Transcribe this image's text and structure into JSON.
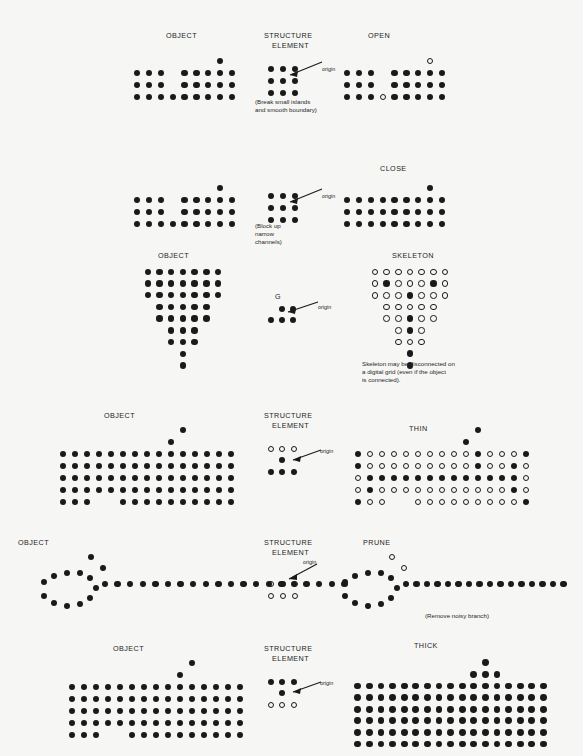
{
  "figure": {
    "title_visible": false,
    "background_color": "#f6f6f4",
    "ink_color": "#1a1a1a",
    "dot_diameter_px": 5.2
  },
  "labels": {
    "object": "OBJECT",
    "structure_element_line1": "STRUCTURE",
    "structure_element_line2": "ELEMENT",
    "open": "OPEN",
    "close": "CLOSE",
    "skeleton": "SKELETON",
    "thin": "THIN",
    "prune": "PRUNE",
    "thick": "THICK",
    "g": "G",
    "origin": "origin"
  },
  "captions": {
    "open_note_line1": "(Break small islands",
    "open_note_line2": "and smooth boundary)",
    "close_note_line1": "(Block up",
    "close_note_line2": "narrow",
    "close_note_line3": "channels)",
    "skeleton_note_line1": "Skeleton may be disconnected on",
    "skeleton_note_line2": "a digital grid (even if the object",
    "skeleton_note_line3": "is connected).",
    "prune_note": "(Remove noisy branch)"
  },
  "rows": [
    {
      "id": "row-open",
      "label_object": "OBJECT",
      "label_se_1": "STRUCTURE",
      "label_se_2": "ELEMENT",
      "label_result": "OPEN",
      "object_grid": {
        "cols": 9,
        "rows": 4,
        "cells": [
          [
            0,
            0,
            0,
            0,
            0,
            0,
            0,
            1,
            0
          ],
          [
            1,
            1,
            1,
            0,
            1,
            1,
            1,
            1,
            1
          ],
          [
            1,
            1,
            1,
            0,
            1,
            1,
            1,
            1,
            1
          ],
          [
            1,
            1,
            1,
            1,
            1,
            1,
            1,
            1,
            1
          ]
        ]
      },
      "se_grid": {
        "cols": 3,
        "rows": 3,
        "cells": [
          [
            1,
            1,
            1
          ],
          [
            1,
            1,
            1
          ],
          [
            1,
            1,
            1
          ]
        ],
        "origin_row": 1,
        "origin_col": 1
      },
      "result_grid": {
        "cols": 9,
        "rows": 4,
        "cells": [
          [
            0,
            0,
            0,
            0,
            0,
            0,
            0,
            2,
            0
          ],
          [
            1,
            1,
            1,
            0,
            1,
            1,
            1,
            1,
            1
          ],
          [
            1,
            1,
            1,
            0,
            1,
            1,
            1,
            1,
            1
          ],
          [
            1,
            1,
            1,
            2,
            1,
            1,
            1,
            1,
            1
          ]
        ]
      }
    },
    {
      "id": "row-close",
      "label_se_1": "STRUCTURE",
      "label_se_2": "ELEMENT",
      "label_result": "CLOSE",
      "object_grid": {
        "cols": 9,
        "rows": 4,
        "cells": [
          [
            0,
            0,
            0,
            0,
            0,
            0,
            0,
            1,
            0
          ],
          [
            1,
            1,
            1,
            0,
            1,
            1,
            1,
            1,
            1
          ],
          [
            1,
            1,
            1,
            0,
            1,
            1,
            1,
            1,
            1
          ],
          [
            1,
            1,
            1,
            1,
            1,
            1,
            1,
            1,
            1
          ]
        ]
      },
      "se_grid": {
        "cols": 3,
        "rows": 3,
        "cells": [
          [
            1,
            1,
            1
          ],
          [
            1,
            1,
            1
          ],
          [
            1,
            1,
            1
          ]
        ],
        "origin_row": 1,
        "origin_col": 1
      },
      "result_grid": {
        "cols": 9,
        "rows": 4,
        "cells": [
          [
            0,
            0,
            0,
            0,
            0,
            0,
            0,
            1,
            0
          ],
          [
            1,
            1,
            1,
            1,
            1,
            1,
            1,
            1,
            1
          ],
          [
            1,
            1,
            1,
            1,
            1,
            1,
            1,
            1,
            1
          ],
          [
            1,
            1,
            1,
            1,
            1,
            1,
            1,
            1,
            1
          ]
        ]
      }
    },
    {
      "id": "row-skeleton",
      "label_object": "OBJECT",
      "label_se": "G",
      "label_result": "SKELETON",
      "object_grid": {
        "cols": 7,
        "rows": 9,
        "cells": [
          [
            1,
            1,
            1,
            1,
            1,
            1,
            1
          ],
          [
            1,
            1,
            1,
            1,
            1,
            1,
            1
          ],
          [
            1,
            1,
            1,
            1,
            1,
            1,
            1
          ],
          [
            0,
            1,
            1,
            1,
            1,
            1,
            0
          ],
          [
            0,
            1,
            1,
            1,
            1,
            1,
            0
          ],
          [
            0,
            0,
            1,
            1,
            1,
            0,
            0
          ],
          [
            0,
            0,
            1,
            1,
            1,
            0,
            0
          ],
          [
            0,
            0,
            0,
            1,
            0,
            0,
            0
          ],
          [
            0,
            0,
            0,
            1,
            0,
            0,
            0
          ]
        ]
      },
      "se_grid": {
        "cols": 3,
        "rows": 2,
        "cells": [
          [
            0,
            1,
            1
          ],
          [
            1,
            1,
            1
          ]
        ],
        "origin_row": 0,
        "origin_col": 2
      },
      "result_grid": {
        "cols": 7,
        "rows": 9,
        "cells": [
          [
            2,
            2,
            2,
            2,
            2,
            2,
            2
          ],
          [
            2,
            1,
            2,
            2,
            2,
            1,
            2
          ],
          [
            2,
            2,
            2,
            1,
            2,
            2,
            2
          ],
          [
            0,
            2,
            2,
            2,
            2,
            2,
            0
          ],
          [
            0,
            2,
            2,
            1,
            2,
            2,
            0
          ],
          [
            0,
            0,
            2,
            1,
            2,
            0,
            0
          ],
          [
            0,
            0,
            2,
            2,
            2,
            0,
            0
          ],
          [
            0,
            0,
            0,
            1,
            0,
            0,
            0
          ],
          [
            0,
            0,
            0,
            1,
            0,
            0,
            0
          ]
        ]
      }
    },
    {
      "id": "row-thin",
      "label_object": "OBJECT",
      "label_se_1": "STRUCTURE",
      "label_se_2": "ELEMENT",
      "label_result": "THIN",
      "object_grid": {
        "cols": 15,
        "rows": 7,
        "cells": [
          [
            0,
            0,
            0,
            0,
            0,
            0,
            0,
            0,
            0,
            0,
            1,
            0,
            0,
            0,
            0
          ],
          [
            0,
            0,
            0,
            0,
            0,
            0,
            0,
            0,
            0,
            1,
            0,
            0,
            0,
            0,
            0
          ],
          [
            1,
            1,
            1,
            1,
            1,
            1,
            1,
            1,
            1,
            1,
            1,
            1,
            1,
            1,
            1
          ],
          [
            1,
            1,
            1,
            1,
            1,
            1,
            1,
            1,
            1,
            1,
            1,
            1,
            1,
            1,
            1
          ],
          [
            1,
            1,
            1,
            1,
            1,
            1,
            1,
            1,
            1,
            1,
            1,
            1,
            1,
            1,
            1
          ],
          [
            1,
            1,
            1,
            1,
            1,
            1,
            1,
            1,
            1,
            1,
            1,
            1,
            1,
            1,
            1
          ],
          [
            1,
            1,
            1,
            0,
            0,
            1,
            1,
            1,
            1,
            1,
            1,
            1,
            1,
            1,
            1
          ]
        ]
      },
      "se_grid": {
        "cols": 3,
        "rows": 3,
        "cells": [
          [
            2,
            2,
            2
          ],
          [
            0,
            1,
            0
          ],
          [
            1,
            1,
            1
          ]
        ],
        "origin_row": 0,
        "origin_col": 2
      },
      "result_grid": {
        "cols": 15,
        "rows": 7,
        "cells": [
          [
            0,
            0,
            0,
            0,
            0,
            0,
            0,
            0,
            0,
            0,
            1,
            0,
            0,
            0,
            0
          ],
          [
            0,
            0,
            0,
            0,
            0,
            0,
            0,
            0,
            0,
            1,
            0,
            0,
            0,
            0,
            0
          ],
          [
            1,
            2,
            2,
            2,
            2,
            2,
            2,
            2,
            2,
            2,
            1,
            2,
            2,
            2,
            1
          ],
          [
            1,
            2,
            2,
            2,
            2,
            2,
            2,
            2,
            2,
            2,
            1,
            2,
            2,
            1,
            2
          ],
          [
            2,
            1,
            1,
            1,
            1,
            1,
            1,
            1,
            1,
            1,
            1,
            1,
            1,
            1,
            2
          ],
          [
            2,
            1,
            2,
            2,
            2,
            2,
            2,
            2,
            2,
            2,
            2,
            2,
            2,
            1,
            2
          ],
          [
            1,
            2,
            2,
            0,
            0,
            2,
            2,
            2,
            2,
            2,
            2,
            2,
            2,
            2,
            1
          ]
        ]
      }
    },
    {
      "id": "row-prune",
      "label_object": "OBJECT",
      "label_se_1": "STRUCTURE",
      "label_se_2": "ELEMENT",
      "label_result": "PRUNE",
      "object_shape": "loop-with-tail-and-branch",
      "se_grid": {
        "cols": 3,
        "rows": 2,
        "cells": [
          [
            2,
            1,
            2
          ],
          [
            2,
            2,
            2
          ]
        ],
        "origin_row": 0,
        "origin_col": 1
      }
    },
    {
      "id": "row-thick",
      "label_object": "OBJECT",
      "label_se_1": "STRUCTURE",
      "label_se_2": "ELEMENT",
      "label_result": "THICK",
      "object_grid": {
        "cols": 15,
        "rows": 7,
        "cells": [
          [
            0,
            0,
            0,
            0,
            0,
            0,
            0,
            0,
            0,
            0,
            1,
            0,
            0,
            0,
            0
          ],
          [
            0,
            0,
            0,
            0,
            0,
            0,
            0,
            0,
            0,
            1,
            0,
            0,
            0,
            0,
            0
          ],
          [
            1,
            1,
            1,
            1,
            1,
            1,
            1,
            1,
            1,
            1,
            1,
            1,
            1,
            1,
            1
          ],
          [
            1,
            1,
            1,
            1,
            1,
            1,
            1,
            1,
            1,
            1,
            1,
            1,
            1,
            1,
            1
          ],
          [
            1,
            1,
            1,
            1,
            1,
            1,
            1,
            1,
            1,
            1,
            1,
            1,
            1,
            1,
            1
          ],
          [
            1,
            1,
            1,
            1,
            1,
            1,
            1,
            1,
            1,
            1,
            1,
            1,
            1,
            1,
            1
          ],
          [
            1,
            1,
            1,
            0,
            0,
            1,
            1,
            1,
            1,
            1,
            1,
            1,
            1,
            1,
            1
          ]
        ]
      },
      "se_grid": {
        "cols": 3,
        "rows": 3,
        "cells": [
          [
            1,
            1,
            1
          ],
          [
            0,
            1,
            0
          ],
          [
            2,
            2,
            2
          ]
        ],
        "origin_row": 0,
        "origin_col": 2
      },
      "result_grid": {
        "cols": 17,
        "rows": 8,
        "cells": [
          [
            0,
            0,
            0,
            0,
            0,
            0,
            0,
            0,
            0,
            0,
            0,
            1,
            0,
            0,
            0,
            0,
            0
          ],
          [
            0,
            0,
            0,
            0,
            0,
            0,
            0,
            0,
            0,
            0,
            1,
            1,
            1,
            0,
            0,
            0,
            0
          ],
          [
            1,
            1,
            1,
            1,
            1,
            1,
            1,
            1,
            1,
            1,
            1,
            1,
            1,
            1,
            1,
            1,
            1
          ],
          [
            1,
            1,
            1,
            1,
            1,
            1,
            1,
            1,
            1,
            1,
            1,
            1,
            1,
            1,
            1,
            1,
            1
          ],
          [
            1,
            1,
            1,
            1,
            1,
            1,
            1,
            1,
            1,
            1,
            1,
            1,
            1,
            1,
            1,
            1,
            1
          ],
          [
            1,
            1,
            1,
            1,
            1,
            1,
            1,
            1,
            1,
            1,
            1,
            1,
            1,
            1,
            1,
            1,
            1
          ],
          [
            1,
            1,
            1,
            1,
            1,
            1,
            1,
            1,
            1,
            1,
            1,
            1,
            1,
            1,
            1,
            1,
            1
          ],
          [
            1,
            1,
            1,
            1,
            1,
            1,
            1,
            1,
            1,
            1,
            1,
            1,
            1,
            1,
            1,
            1,
            1
          ]
        ]
      }
    }
  ],
  "prune_object_dots": {
    "loop": [
      [
        44,
        582
      ],
      [
        54,
        576
      ],
      [
        67,
        573
      ],
      [
        80,
        573
      ],
      [
        90,
        578
      ],
      [
        96,
        588
      ],
      [
        90,
        598
      ],
      [
        80,
        604
      ],
      [
        67,
        606
      ],
      [
        54,
        603
      ],
      [
        44,
        596
      ]
    ],
    "branch": [
      [
        91,
        557
      ],
      [
        103,
        568
      ]
    ],
    "tail_start_x": 105,
    "tail_y": 584,
    "tail_count": 20,
    "tail_step": 12.6
  },
  "prune_result_dots": {
    "loop": [
      [
        345,
        582
      ],
      [
        355,
        576
      ],
      [
        368,
        573
      ],
      [
        381,
        573
      ],
      [
        391,
        578
      ],
      [
        397,
        588
      ],
      [
        391,
        598
      ],
      [
        381,
        604
      ],
      [
        368,
        606
      ],
      [
        355,
        603
      ],
      [
        345,
        596
      ]
    ],
    "branch_removed": [
      [
        392,
        557
      ],
      [
        404,
        568
      ]
    ],
    "tail_start_x": 406,
    "tail_y": 584,
    "tail_count": 16,
    "tail_step": 10.5
  }
}
